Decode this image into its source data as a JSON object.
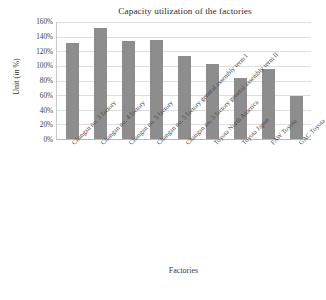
{
  "chart_data": {
    "type": "bar",
    "title": "Capacity utilization of the factories",
    "xlabel": "Factories",
    "ylabel": "Unit (in %)",
    "categories": [
      "Changan no. 3 factory",
      "Changan no. 4 factory",
      "Changan no. 5 factory",
      "Changan no. 5 factory general assembly term I",
      "Changan no. 5 factory general assembly term II",
      "Toyota North America",
      "Toyota Japan",
      "FAW Toyota",
      "GAC Toyota"
    ],
    "values": [
      131,
      152,
      134,
      135,
      113,
      103,
      83,
      96,
      59
    ],
    "value_labels": [
      "131%",
      "152%",
      "134%",
      "135%",
      "113%",
      "103%",
      "83%",
      "96%",
      "59%"
    ],
    "ylim": [
      0,
      160
    ],
    "ytick_labels": [
      "160%",
      "140%",
      "120%",
      "100%",
      "80%",
      "60%",
      "40%",
      "20%",
      "0%"
    ],
    "ytick_values": [
      160,
      140,
      120,
      100,
      80,
      60,
      40,
      20,
      0
    ],
    "grid": true,
    "legend": false,
    "bar_color": "#8d8d8d",
    "grid_color": "#dedede",
    "axis_color": "#b9b9b9",
    "background": "#ffffff"
  }
}
